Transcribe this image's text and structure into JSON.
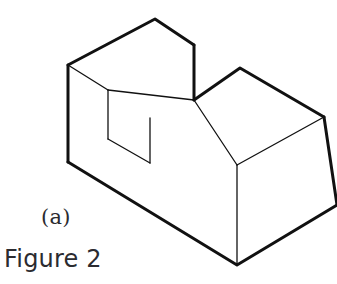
{
  "figure": {
    "caption_main": "Figure 2",
    "caption_sub": "(a)",
    "clipped_header_text": "",
    "background_color": "#ffffff",
    "line_color": "#111111",
    "fill_color": "#ffffff",
    "outline_stroke_width": 3.0,
    "inner_stroke_width": 1.3,
    "projection": "isometric",
    "drawing_type": "line-drawing"
  },
  "geometry": {
    "description": "U-shaped (slotted) block drawn in isometric projection. A rectangular through-slot is cut downward into the top face between the raised left wall and the raised right wall.",
    "vertices": {
      "left_top_back": "68,65",
      "left_block_top_apex": "155,19",
      "left_block_top_right": "194,45",
      "left_block_top_inner": "108,90",
      "left_block_front_bottom": "194,100",
      "left_outer_bottom": "68,162",
      "slot_floor_left": "108,139",
      "slot_floor_front": "150,163",
      "slot_floor_right_edge_top": "150,118",
      "right_block_top_back_apex": "240,68",
      "right_block_top_right": "324,117",
      "right_block_mid_front": "237,165",
      "right_block_bottom_front": "237,265",
      "right_block_bottom_right": "337,205"
    },
    "edges": [
      {
        "name": "top-left-back-edge",
        "from": "left_top_back",
        "to": "left_block_top_apex",
        "kind": "outline"
      },
      {
        "name": "top-right-back-edge",
        "from": "left_block_top_apex",
        "to": "left_block_top_right",
        "kind": "outline"
      },
      {
        "name": "raised-left-wall-front-right-vertical",
        "from": "left_block_top_right",
        "to": "left_block_front_bottom",
        "kind": "outline"
      },
      {
        "name": "slot-left-wall-top-edge",
        "from": "left_top_back",
        "to": "left_block_top_inner",
        "kind": "inner"
      },
      {
        "name": "slot-inner-front-edge",
        "from": "left_block_top_inner",
        "to": "left_block_front_bottom",
        "kind": "inner"
      },
      {
        "name": "slot-left-vertical",
        "from": "left_block_top_inner",
        "to": "slot_floor_left",
        "kind": "inner"
      },
      {
        "name": "slot-floor-left-edge",
        "from": "slot_floor_left",
        "to": "slot_floor_front",
        "kind": "inner"
      },
      {
        "name": "slot-right-vertical",
        "from": "slot_floor_front",
        "to": "slot_floor_right_edge_top",
        "kind": "inner"
      },
      {
        "name": "left-outer-vertical",
        "from": "left_top_back",
        "to": "left_outer_bottom",
        "kind": "outline"
      },
      {
        "name": "base-front-bottom-left-edge",
        "from": "left_outer_bottom",
        "to": "right_block_bottom_front",
        "kind": "outline"
      },
      {
        "name": "right-block-top-back-left-edge",
        "from": "left_block_front_bottom",
        "to": "right_block_top_back_apex",
        "kind": "outline"
      },
      {
        "name": "right-block-top-back-right-edge",
        "from": "right_block_top_back_apex",
        "to": "right_block_top_right",
        "kind": "outline"
      },
      {
        "name": "right-block-top-front-left-edge",
        "from": "left_block_front_bottom",
        "to": "right_block_mid_front",
        "kind": "inner"
      },
      {
        "name": "right-block-top-front-right-edge",
        "from": "right_block_mid_front",
        "to": "right_block_top_right",
        "kind": "inner"
      },
      {
        "name": "right-block-front-vertical",
        "from": "right_block_mid_front",
        "to": "right_block_bottom_front",
        "kind": "inner"
      },
      {
        "name": "right-block-far-right-vertical",
        "from": "right_block_top_right",
        "to": "right_block_bottom_right",
        "kind": "outline"
      },
      {
        "name": "base-front-bottom-right-edge",
        "from": "right_block_bottom_front",
        "to": "right_block_bottom_right",
        "kind": "outline"
      }
    ],
    "faces": [
      {
        "name": "raised-left-wall-top-face",
        "interactable": false
      },
      {
        "name": "left-outer-side-face",
        "interactable": false
      },
      {
        "name": "slot-left-inner-wall",
        "interactable": false
      },
      {
        "name": "slot-floor-face",
        "interactable": false
      },
      {
        "name": "right-block-top-face",
        "interactable": false
      },
      {
        "name": "front-long-face",
        "interactable": false
      },
      {
        "name": "right-block-right-side-face",
        "interactable": false
      }
    ]
  }
}
